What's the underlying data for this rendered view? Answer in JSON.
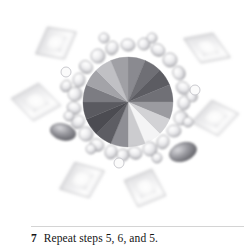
{
  "page": {
    "background_color": "#ffffff",
    "width": 251,
    "height": 251
  },
  "caption": {
    "step_number": "7",
    "text": "Repeat steps 5, 6, and 5.",
    "rule_color": "#d4d4d4",
    "text_color": "#141414"
  },
  "figure": {
    "name": "radial-burst-diagram",
    "center": {
      "x": 128,
      "y": 102
    },
    "colors": {
      "darkest_wedge": "#4a4a50",
      "dark_wedge": "#5a5a60",
      "mid_wedge": "#8d8d92",
      "light_wedge": "#c6c6c9",
      "brightest_wedge": "#fbfbfb",
      "bead_fill": "#ebebed",
      "bead_shade": "#b4b4b8",
      "bead_outline": "#9a9a9f",
      "petal_light": "#fdfdfd",
      "petal_mid": "#e2e2e4",
      "petal_edge": "#a8a8ad",
      "dark_blob": "#6e6e74"
    },
    "pie": {
      "radius": 45,
      "wedge_count": 16,
      "wedge_values": [
        {
          "label": "w1",
          "angle_start": -90,
          "angle_end": -67.5,
          "shade": "#8a8a90"
        },
        {
          "label": "w2",
          "angle_start": -67.5,
          "angle_end": -45,
          "shade": "#6f6f75"
        },
        {
          "label": "w3",
          "angle_start": -45,
          "angle_end": -22.5,
          "shade": "#5c5c62"
        },
        {
          "label": "w4",
          "angle_start": -22.5,
          "angle_end": 0,
          "shade": "#707076"
        },
        {
          "label": "w5",
          "angle_start": 0,
          "angle_end": 22.5,
          "shade": "#9b9ba0"
        },
        {
          "label": "w6",
          "angle_start": 22.5,
          "angle_end": 45,
          "shade": "#d2d2d5"
        },
        {
          "label": "w7",
          "angle_start": 45,
          "angle_end": 67.5,
          "shade": "#f4f4f5"
        },
        {
          "label": "w8",
          "angle_start": 67.5,
          "angle_end": 90,
          "shade": "#cccccf"
        },
        {
          "label": "w9",
          "angle_start": 90,
          "angle_end": 112.5,
          "shade": "#8f8f95"
        },
        {
          "label": "w10",
          "angle_start": 112.5,
          "angle_end": 135,
          "shade": "#5d5d63"
        },
        {
          "label": "w11",
          "angle_start": 135,
          "angle_end": 157.5,
          "shade": "#4c4c52"
        },
        {
          "label": "w12",
          "angle_start": 157.5,
          "angle_end": 180,
          "shade": "#5a5a60"
        },
        {
          "label": "w13",
          "angle_start": 180,
          "angle_end": 202.5,
          "shade": "#7c7c82"
        },
        {
          "label": "w14",
          "angle_start": 202.5,
          "angle_end": 225,
          "shade": "#a3a3a8"
        },
        {
          "label": "w15",
          "angle_start": 225,
          "angle_end": 247.5,
          "shade": "#c0c0c4"
        },
        {
          "label": "w16",
          "angle_start": 247.5,
          "angle_end": 270,
          "shade": "#a0a0a5"
        }
      ]
    },
    "beads": [
      {
        "cx": 128,
        "cy": 45,
        "rx": 7,
        "ry": 6,
        "rot": 10
      },
      {
        "cx": 144,
        "cy": 44,
        "rx": 6,
        "ry": 6,
        "rot": -15
      },
      {
        "cx": 112,
        "cy": 48,
        "rx": 6,
        "ry": 7,
        "rot": 20
      },
      {
        "cx": 158,
        "cy": 50,
        "rx": 7,
        "ry": 6,
        "rot": 30
      },
      {
        "cx": 98,
        "cy": 56,
        "rx": 7,
        "ry": 7,
        "rot": -10
      },
      {
        "cx": 170,
        "cy": 60,
        "rx": 7,
        "ry": 7,
        "rot": 15
      },
      {
        "cx": 86,
        "cy": 67,
        "rx": 7,
        "ry": 6,
        "rot": 40
      },
      {
        "cx": 179,
        "cy": 73,
        "rx": 6,
        "ry": 7,
        "rot": -25
      },
      {
        "cx": 79,
        "cy": 80,
        "rx": 6,
        "ry": 7,
        "rot": 5
      },
      {
        "cx": 183,
        "cy": 88,
        "rx": 7,
        "ry": 6,
        "rot": 35
      },
      {
        "cx": 75,
        "cy": 94,
        "rx": 7,
        "ry": 7,
        "rot": -20
      },
      {
        "cx": 184,
        "cy": 103,
        "rx": 6,
        "ry": 7,
        "rot": 10
      },
      {
        "cx": 74,
        "cy": 108,
        "rx": 7,
        "ry": 6,
        "rot": 25
      },
      {
        "cx": 181,
        "cy": 118,
        "rx": 7,
        "ry": 7,
        "rot": -30
      },
      {
        "cx": 78,
        "cy": 122,
        "rx": 6,
        "ry": 7,
        "rot": 45
      },
      {
        "cx": 174,
        "cy": 131,
        "rx": 7,
        "ry": 6,
        "rot": 0
      },
      {
        "cx": 86,
        "cy": 134,
        "rx": 7,
        "ry": 7,
        "rot": -15
      },
      {
        "cx": 163,
        "cy": 142,
        "rx": 6,
        "ry": 7,
        "rot": 20
      },
      {
        "cx": 97,
        "cy": 145,
        "rx": 7,
        "ry": 6,
        "rot": 30
      },
      {
        "cx": 150,
        "cy": 149,
        "rx": 7,
        "ry": 7,
        "rot": -10
      },
      {
        "cx": 111,
        "cy": 152,
        "rx": 6,
        "ry": 7,
        "rot": 15
      },
      {
        "cx": 135,
        "cy": 153,
        "rx": 7,
        "ry": 6,
        "rot": 25
      },
      {
        "cx": 123,
        "cy": 155,
        "rx": 6,
        "ry": 6,
        "rot": -20
      },
      {
        "cx": 104,
        "cy": 38,
        "rx": 5,
        "ry": 5,
        "rot": 0
      },
      {
        "cx": 152,
        "cy": 38,
        "rx": 5,
        "ry": 5,
        "rot": 0
      },
      {
        "cx": 66,
        "cy": 86,
        "rx": 5,
        "ry": 6,
        "rot": 30
      },
      {
        "cx": 192,
        "cy": 96,
        "rx": 5,
        "ry": 6,
        "rot": -30
      },
      {
        "cx": 69,
        "cy": 116,
        "rx": 5,
        "ry": 5,
        "rot": 10
      },
      {
        "cx": 188,
        "cy": 122,
        "rx": 5,
        "ry": 5,
        "rot": 20
      },
      {
        "cx": 91,
        "cy": 149,
        "rx": 5,
        "ry": 5,
        "rot": 0
      },
      {
        "cx": 157,
        "cy": 158,
        "rx": 5,
        "ry": 5,
        "rot": 15
      }
    ],
    "petals": [
      {
        "name": "petal-top-left",
        "cx": 56,
        "cy": 43,
        "w": 46,
        "h": 36,
        "rot": -28
      },
      {
        "name": "petal-top-right",
        "cx": 207,
        "cy": 48,
        "w": 50,
        "h": 32,
        "rot": 22
      },
      {
        "name": "petal-left",
        "cx": 36,
        "cy": 102,
        "w": 50,
        "h": 38,
        "rot": 8
      },
      {
        "name": "petal-right",
        "cx": 215,
        "cy": 118,
        "w": 48,
        "h": 36,
        "rot": -10
      },
      {
        "name": "petal-bottom-left",
        "cx": 82,
        "cy": 180,
        "w": 48,
        "h": 38,
        "rot": -22
      },
      {
        "name": "petal-bottom-right",
        "cx": 145,
        "cy": 188,
        "w": 44,
        "h": 40,
        "rot": 20
      }
    ],
    "dark_blobs": [
      {
        "name": "dark-blob-lower-right",
        "cx": 183,
        "cy": 152,
        "rx": 14,
        "ry": 9,
        "rot": -20
      },
      {
        "name": "dark-blob-lower-left",
        "cx": 63,
        "cy": 132,
        "rx": 13,
        "ry": 8,
        "rot": 15
      }
    ],
    "small_rings": [
      {
        "name": "small-ring-upper-left",
        "cx": 66,
        "cy": 72,
        "r": 5
      },
      {
        "name": "small-ring-right",
        "cx": 195,
        "cy": 90,
        "r": 5
      },
      {
        "name": "small-ring-bottom-center",
        "cx": 119,
        "cy": 163,
        "r": 5
      }
    ]
  }
}
